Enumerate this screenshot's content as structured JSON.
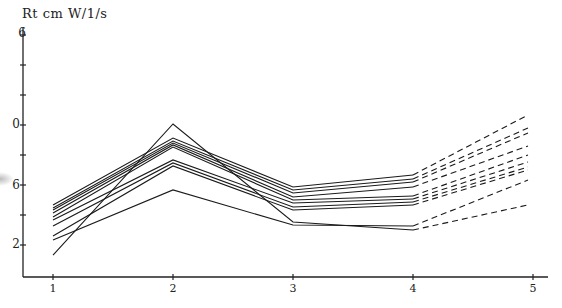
{
  "chart_data": {
    "type": "line",
    "title": "",
    "ylabel": "Rt cm W/1/s",
    "xlabel": "",
    "x": [
      1,
      2,
      3,
      4,
      5
    ],
    "xticks": [
      "1",
      "2",
      "3",
      "4",
      "5"
    ],
    "yticks_visible_labels": [
      {
        "value": 16,
        "label": "6"
      },
      {
        "value": 10,
        "label": "0"
      },
      {
        "value": 6,
        "label": "6"
      },
      {
        "value": 2,
        "label": "2"
      }
    ],
    "ytick_values": [
      16,
      14,
      12,
      10,
      8,
      6,
      4,
      2
    ],
    "ylim": [
      0,
      16
    ],
    "xlim": [
      0.7,
      5.2
    ],
    "grid": false,
    "legend": null,
    "series": [
      {
        "name": "s1",
        "values": [
          1.33,
          10.07,
          3.53,
          3.0,
          4.67
        ]
      },
      {
        "name": "s2",
        "values": [
          4.67,
          9.13,
          5.87,
          6.67,
          10.67
        ]
      },
      {
        "name": "s3",
        "values": [
          4.47,
          8.93,
          5.67,
          6.4,
          9.8
        ]
      },
      {
        "name": "s4",
        "values": [
          4.33,
          8.8,
          5.47,
          6.2,
          9.47
        ]
      },
      {
        "name": "s5",
        "values": [
          4.13,
          8.67,
          5.2,
          5.87,
          8.6
        ]
      },
      {
        "name": "s6",
        "values": [
          3.87,
          8.53,
          5.0,
          5.27,
          8.0
        ]
      },
      {
        "name": "s7",
        "values": [
          3.67,
          7.67,
          4.8,
          5.07,
          7.53
        ]
      },
      {
        "name": "s8",
        "values": [
          3.27,
          7.47,
          4.53,
          4.87,
          7.2
        ]
      },
      {
        "name": "s9",
        "values": [
          2.6,
          7.27,
          4.33,
          4.67,
          7.0
        ]
      },
      {
        "name": "s10",
        "values": [
          2.33,
          5.67,
          3.33,
          3.27,
          6.33
        ]
      }
    ]
  },
  "labels": {
    "y_title": "Rt cm W/1/s",
    "y_ticks": [
      {
        "text": "6",
        "y": 34
      },
      {
        "text": "0",
        "y": 125
      },
      {
        "text": "6",
        "y": 186
      },
      {
        "text": "2",
        "y": 245
      }
    ],
    "x_ticks": [
      {
        "text": "1"
      },
      {
        "text": "2"
      },
      {
        "text": "3"
      },
      {
        "text": "4"
      },
      {
        "text": "5"
      }
    ]
  }
}
